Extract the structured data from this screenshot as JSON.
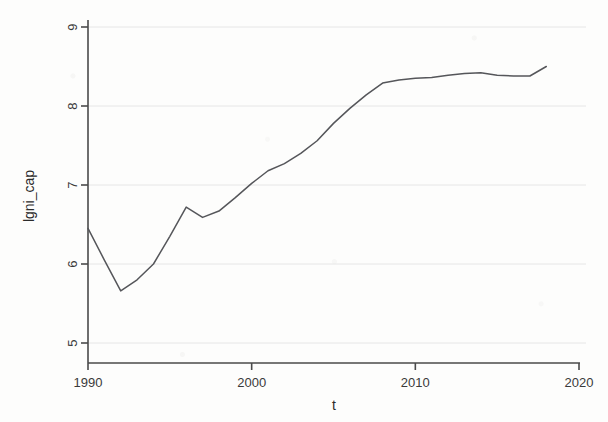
{
  "figure": {
    "background_color": "#fdfdfc",
    "line_color": "#55565a",
    "axis_color": "#4a4a4a",
    "grid_color": "#e6e6e6"
  },
  "axes": {
    "y_title": "lgni_cap",
    "x_title": "t",
    "y_ticks": [
      "5",
      "6",
      "7",
      "8",
      "9"
    ],
    "x_ticks": [
      "1990",
      "2000",
      "2010",
      "2020"
    ]
  },
  "chart_data": {
    "type": "line",
    "title": "",
    "xlabel": "t",
    "ylabel": "lgni_cap",
    "xlim": [
      1990,
      2020
    ],
    "ylim": [
      5,
      9
    ],
    "xticks": [
      1990,
      2000,
      2010,
      2020
    ],
    "yticks": [
      5,
      6,
      7,
      8,
      9
    ],
    "grid": true,
    "grid_axis": "y",
    "legend": "none",
    "series": [
      {
        "name": "lgni_cap",
        "color": "#55565a",
        "x": [
          1990,
          1991,
          1992,
          1993,
          1994,
          1995,
          1996,
          1997,
          1998,
          1999,
          2000,
          2001,
          2002,
          2003,
          2004,
          2005,
          2006,
          2007,
          2008,
          2009,
          2010,
          2011,
          2012,
          2013,
          2014,
          2015,
          2016,
          2017,
          2018
        ],
        "values": [
          6.45,
          6.05,
          5.66,
          5.8,
          6.0,
          6.35,
          6.72,
          6.59,
          6.67,
          6.84,
          7.02,
          7.18,
          7.27,
          7.4,
          7.56,
          7.78,
          7.97,
          8.14,
          8.29,
          8.33,
          8.35,
          8.36,
          8.39,
          8.41,
          8.42,
          8.39,
          8.38,
          8.38,
          8.5
        ]
      }
    ]
  }
}
